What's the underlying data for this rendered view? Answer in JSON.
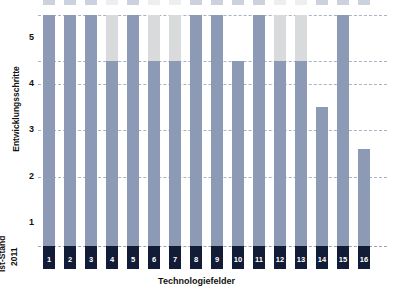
{
  "chart_data": {
    "type": "bar",
    "title": "",
    "xlabel": "Technologiefelder",
    "ylabel": "Entwicklungsschritte",
    "ylim": [
      0,
      5.5
    ],
    "grid": true,
    "legend": "none",
    "yticks": [
      "5",
      "4",
      "3",
      "2",
      "1"
    ],
    "ytick_values": [
      5,
      4,
      3,
      2,
      1
    ],
    "baseline_label_line1": "Ist-Stand",
    "baseline_label_line2": "2011",
    "categories": [
      "1",
      "2",
      "3",
      "4",
      "5",
      "6",
      "7",
      "8",
      "9",
      "10",
      "11",
      "12",
      "13",
      "14",
      "15",
      "16"
    ],
    "series": [
      {
        "name": "Ist-Stand 2011",
        "color": "#121c36",
        "values": [
          0.5,
          0.5,
          0.5,
          0.5,
          0.5,
          0.5,
          0.5,
          0.5,
          0.5,
          0.5,
          0.5,
          0.5,
          0.5,
          0.5,
          0.5,
          0.5
        ]
      },
      {
        "name": "Entwicklungsschritte",
        "color": "#8d9ab5",
        "values": [
          5.5,
          5.5,
          5.5,
          4.5,
          5.5,
          4.5,
          4.5,
          5.5,
          5.5,
          4.5,
          5.5,
          4.5,
          4.5,
          3.5,
          5.5,
          2.6
        ]
      },
      {
        "name": "Weiterer Entwicklungsbedarf",
        "color": "#d9dadb",
        "values": [
          0,
          0,
          0,
          1.0,
          0,
          1.0,
          1.0,
          0,
          0,
          0,
          0,
          1.0,
          1.0,
          0,
          0,
          0
        ]
      }
    ],
    "totals": [
      5.5,
      5.5,
      5.5,
      5.5,
      5.5,
      5.5,
      5.5,
      5.5,
      5.5,
      4.5,
      5.5,
      5.5,
      5.5,
      3.5,
      5.5,
      2.6
    ],
    "gridline_values": [
      5.5,
      4.5,
      4,
      3,
      2,
      0.5
    ]
  },
  "colors": {
    "base_navy": "#121c36",
    "body_blue": "#8d9ab5",
    "cap_gray": "#d9dadb",
    "gridline": "#9aa7bb",
    "text": "#111111",
    "background": "#ffffff"
  }
}
